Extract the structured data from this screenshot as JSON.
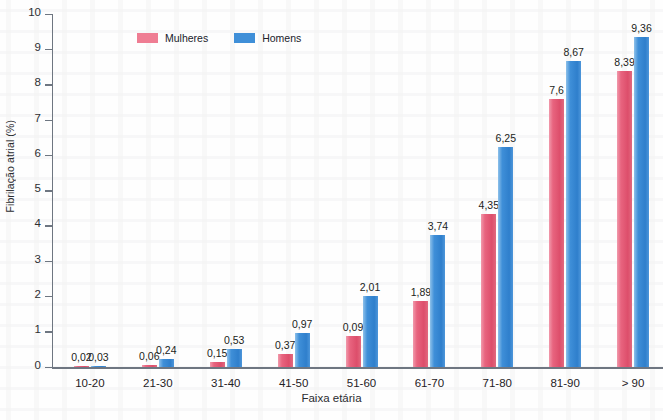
{
  "chart_data": {
    "type": "bar",
    "title": "",
    "xlabel": "Faixa etária",
    "ylabel": "Fibrilação atrial (%)",
    "ylim": [
      0,
      10
    ],
    "yticks": [
      "0",
      "1",
      "2",
      "3",
      "4",
      "5",
      "6",
      "7",
      "8",
      "9",
      "10"
    ],
    "grid": false,
    "legend_position": "top-left",
    "categories": [
      "10-20",
      "21-30",
      "31-40",
      "41-50",
      "51-60",
      "61-70",
      "71-80",
      "81-90",
      "> 90"
    ],
    "series": [
      {
        "name": "Mulheres",
        "color": "#e8647f",
        "values": [
          0.02,
          0.06,
          0.15,
          0.37,
          0.9,
          1.89,
          4.35,
          7.6,
          8.39
        ],
        "labels": [
          "0,02",
          "0,06",
          "0,15",
          "0,37",
          "0,09",
          "1,89",
          "4,35",
          "7,6",
          "8,39"
        ]
      },
      {
        "name": "Homens",
        "color": "#3f8fd8",
        "values": [
          0.03,
          0.24,
          0.53,
          0.97,
          2.01,
          3.74,
          6.25,
          8.67,
          9.36
        ],
        "labels": [
          "0,03",
          "0,24",
          "0,53",
          "0,97",
          "2,01",
          "3,74",
          "6,25",
          "8,67",
          "9,36"
        ]
      }
    ]
  },
  "legend": {
    "items": [
      {
        "label": "Mulheres",
        "swatch": "legend-swatch-female"
      },
      {
        "label": "Homens",
        "swatch": "legend-swatch-male"
      }
    ]
  },
  "axes": {
    "y_title": "Fibrilação atrial (%)",
    "x_title": "Faixa etária"
  }
}
